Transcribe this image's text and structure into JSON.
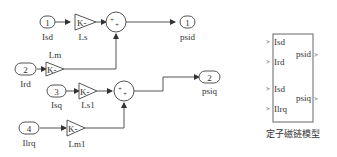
{
  "diagram": {
    "inports": [
      {
        "num": "1",
        "label": "Isd"
      },
      {
        "num": "2",
        "label": "Ird"
      },
      {
        "num": "3",
        "label": "Isq"
      },
      {
        "num": "4",
        "label": "Ilrq"
      }
    ],
    "gains": [
      {
        "glyph": "K-",
        "label": "Ls"
      },
      {
        "glyph": "K-",
        "label": "Lm"
      },
      {
        "glyph": "K-",
        "label": "Ls1"
      },
      {
        "glyph": "K-",
        "label": "Lm1"
      }
    ],
    "sums": [
      {
        "signs": "++"
      },
      {
        "signs": "++"
      }
    ],
    "outports": [
      {
        "num": "1",
        "label": "psid"
      },
      {
        "num": "2",
        "label": "psiq"
      }
    ],
    "subsystem": {
      "name": "定子磁链模型",
      "inputs": [
        "Isd",
        "Ird",
        "Isd",
        "Ilrq"
      ],
      "outputs": [
        "psid",
        "psiq"
      ]
    }
  }
}
